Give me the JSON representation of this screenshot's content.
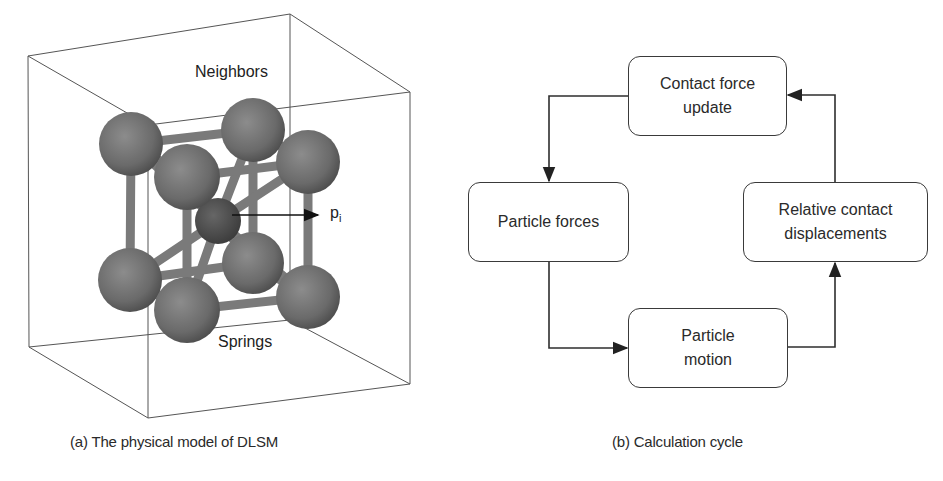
{
  "figure": {
    "panel_a": {
      "caption": "(a) The physical model of DLSM",
      "labels": {
        "neighbors": "Neighbors",
        "springs": "Springs",
        "particle": "p",
        "particle_subscript": "i"
      }
    },
    "panel_b": {
      "caption": "(b) Calculation cycle",
      "boxes": [
        {
          "id": "contact-force-update",
          "line1": "Contact force",
          "line2": "update"
        },
        {
          "id": "particle-forces",
          "line1": "Particle forces",
          "line2": ""
        },
        {
          "id": "particle-motion",
          "line1": "Particle",
          "line2": "motion"
        },
        {
          "id": "relative-contact-displacements",
          "line1": "Relative contact",
          "line2": "displacements"
        }
      ],
      "flow": [
        "Contact force update -> Particle forces",
        "Particle forces -> Particle motion",
        "Particle motion -> Relative contact displacements",
        "Relative contact displacements -> Contact force update"
      ]
    },
    "colors": {
      "line": "#3a3a3a",
      "sphere": "#6e6e6e",
      "sphere_center": "#4a4a4a",
      "spring": "#7a7a7a",
      "background": "#ffffff"
    }
  }
}
